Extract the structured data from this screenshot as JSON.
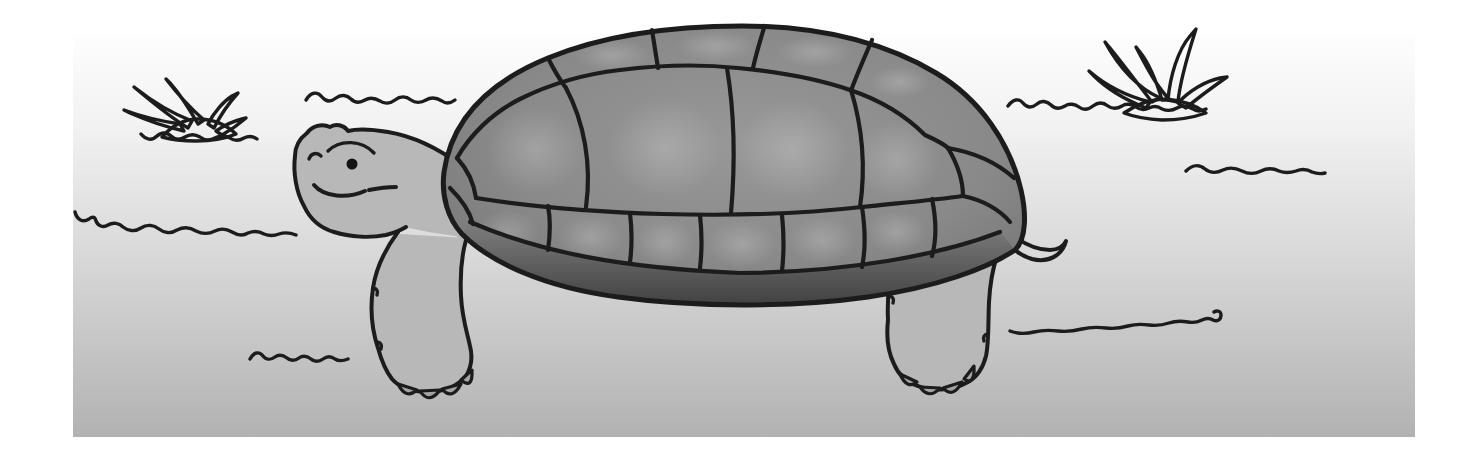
{
  "scene": {
    "description": "Grayscale cartoon clipart of a tortoise walking to the left across sandy ground, with two spiky tufts of grass and wavy squiggle lines marking the ground.",
    "subject": "tortoise",
    "style": "grayscale clipart illustration",
    "facing_direction": "left",
    "expression": "frowning",
    "setting": "sandy desert ground panel with white margins"
  },
  "counts": {
    "grass_tufts": 2,
    "ground_squiggles": 7,
    "claws_per_foot": 4,
    "visible_legs": 2
  },
  "colors": {
    "page_background": "#ffffff",
    "panel_top": "#fcfcfc",
    "panel_bottom": "#b2b2b2",
    "outline": "#1c1c1c",
    "skin": "#b8b8b8",
    "shell_mid": "#8a8a8a",
    "shell_rim_dark": "#3f3f3f",
    "grass": "#9c9c9c",
    "claw": "#a4a4a4",
    "eye": "#141414"
  }
}
